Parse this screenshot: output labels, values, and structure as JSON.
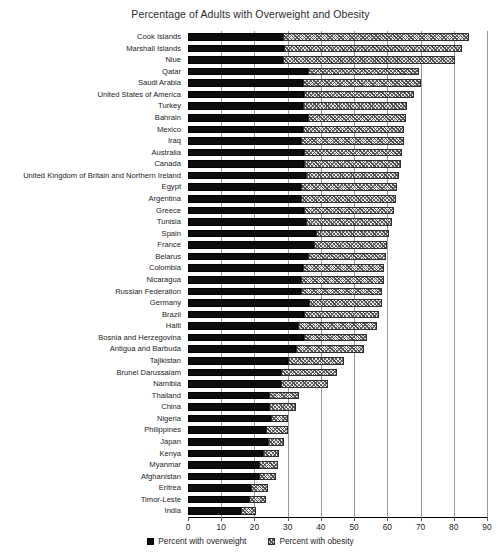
{
  "chart_data": {
    "type": "bar",
    "orientation": "horizontal",
    "stacked": true,
    "title": "Percentage of Adults with Overweight and Obesity",
    "xlabel": "",
    "ylabel": "",
    "xlim": [
      0,
      90
    ],
    "xticks": [
      0,
      10,
      20,
      30,
      40,
      50,
      60,
      70,
      80,
      90
    ],
    "grid": "vertical",
    "legend_position": "bottom",
    "categories": [
      "Cook Islands",
      "Marshall Islands",
      "Niue",
      "Qatar",
      "Saudi Arabia",
      "United States of America",
      "Turkey",
      "Bahrain",
      "Mexico",
      "Iraq",
      "Australia",
      "Canada",
      "United Kingdom of Britain and Northern Ireland",
      "Egypt",
      "Argentina",
      "Greece",
      "Tunisia",
      "Spain",
      "France",
      "Belarus",
      "Colombia",
      "Nicaragua",
      "Russian Federation",
      "Germany",
      "Brazil",
      "Haiti",
      "Bosnia and Herzegovina",
      "Antigua and Barbuda",
      "Tajikistan",
      "Brunei Darussalam",
      "Namibia",
      "Thailand",
      "China",
      "Nigeria",
      "Philippines",
      "Japan",
      "Kenya",
      "Myanmar",
      "Afghanistan",
      "Eritrea",
      "Timor-Leste",
      "India"
    ],
    "series": [
      {
        "name": "Percent with overweight",
        "color": "#0d0d0d",
        "values": [
          28.5,
          29.0,
          28.5,
          36.0,
          34.5,
          35.0,
          34.5,
          36.0,
          34.5,
          34.0,
          35.0,
          35.0,
          35.5,
          34.0,
          34.0,
          35.0,
          35.5,
          38.5,
          38.0,
          36.0,
          34.5,
          34.0,
          34.0,
          36.5,
          35.0,
          33.0,
          35.0,
          32.5,
          30.0,
          28.0,
          28.0,
          24.5,
          24.5,
          25.0,
          23.5,
          24.0,
          22.5,
          21.5,
          21.5,
          19.0,
          18.5,
          16.0
        ]
      },
      {
        "name": "Percent with obesity",
        "color": "#e9e9e9",
        "values": [
          56.0,
          53.5,
          52.0,
          33.5,
          35.5,
          33.0,
          31.5,
          29.5,
          30.5,
          31.0,
          29.5,
          29.0,
          28.0,
          29.0,
          28.5,
          27.0,
          26.0,
          22.0,
          22.0,
          23.5,
          24.5,
          25.0,
          24.5,
          22.0,
          22.5,
          24.0,
          19.0,
          20.5,
          17.0,
          17.0,
          14.0,
          9.0,
          8.0,
          5.0,
          6.5,
          5.0,
          5.0,
          5.5,
          5.0,
          5.0,
          5.0,
          4.5
        ]
      }
    ],
    "totals": [
      84.5,
      82.5,
      80.5,
      69.5,
      70.0,
      68.0,
      66.0,
      65.5,
      65.0,
      65.0,
      64.5,
      64.0,
      63.5,
      63.0,
      62.5,
      62.0,
      61.5,
      60.5,
      60.0,
      59.5,
      59.0,
      59.0,
      58.5,
      58.5,
      57.5,
      57.0,
      54.0,
      53.0,
      47.0,
      45.0,
      42.0,
      33.5,
      32.5,
      30.0,
      30.0,
      29.0,
      27.5,
      27.0,
      26.5,
      24.0,
      23.5,
      20.5
    ]
  },
  "legend": {
    "items": [
      {
        "label": "Percent with overweight",
        "icon": "solid-square-swatch"
      },
      {
        "label": "Percent with obesity",
        "icon": "hatched-square-swatch"
      }
    ]
  }
}
